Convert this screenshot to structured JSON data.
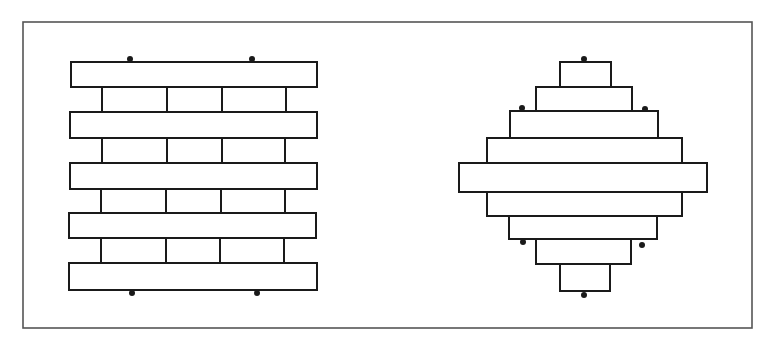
{
  "diagram": {
    "colors": {
      "stroke": "#1a1a1a",
      "frame": "#555555",
      "fill": "#ffffff",
      "background": "#ffffff"
    },
    "frame": {
      "x": 23,
      "y": 22,
      "w": 729,
      "h": 306
    },
    "left_figure": {
      "name": "straight-bond-wall",
      "long_bars": [
        {
          "x": 71,
          "y": 62,
          "w": 246,
          "h": 25
        },
        {
          "x": 70,
          "y": 112,
          "w": 247,
          "h": 26
        },
        {
          "x": 70,
          "y": 163,
          "w": 247,
          "h": 26
        },
        {
          "x": 69,
          "y": 213,
          "w": 247,
          "h": 25
        },
        {
          "x": 69,
          "y": 263,
          "w": 248,
          "h": 27
        }
      ],
      "short_rows": [
        {
          "y": 87,
          "h": 25,
          "dividers": [
            102,
            167,
            222,
            286
          ]
        },
        {
          "y": 138,
          "h": 25,
          "dividers": [
            102,
            167,
            222,
            285
          ]
        },
        {
          "y": 189,
          "h": 24,
          "dividers": [
            101,
            166,
            221,
            285
          ]
        },
        {
          "y": 238,
          "h": 25,
          "dividers": [
            101,
            166,
            220,
            284
          ]
        }
      ],
      "dots": [
        {
          "x": 130,
          "y": 59
        },
        {
          "x": 252,
          "y": 59
        },
        {
          "x": 132,
          "y": 293
        },
        {
          "x": 257,
          "y": 293
        }
      ]
    },
    "right_figure": {
      "name": "stepped-diamond-stack",
      "blocks": [
        {
          "x": 560,
          "y": 62,
          "w": 51,
          "h": 25
        },
        {
          "x": 536,
          "y": 87,
          "w": 96,
          "h": 24
        },
        {
          "x": 510,
          "y": 111,
          "w": 148,
          "h": 27
        },
        {
          "x": 487,
          "y": 138,
          "w": 195,
          "h": 25
        },
        {
          "x": 459,
          "y": 163,
          "w": 248,
          "h": 29
        },
        {
          "x": 487,
          "y": 192,
          "w": 195,
          "h": 24
        },
        {
          "x": 509,
          "y": 216,
          "w": 148,
          "h": 23
        },
        {
          "x": 536,
          "y": 239,
          "w": 95,
          "h": 25
        },
        {
          "x": 560,
          "y": 264,
          "w": 50,
          "h": 27
        }
      ],
      "dots": [
        {
          "x": 584,
          "y": 59
        },
        {
          "x": 522,
          "y": 108
        },
        {
          "x": 645,
          "y": 109
        },
        {
          "x": 523,
          "y": 242
        },
        {
          "x": 642,
          "y": 245
        },
        {
          "x": 584,
          "y": 295
        }
      ]
    }
  }
}
